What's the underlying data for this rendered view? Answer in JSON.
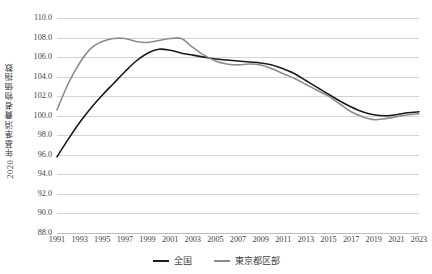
{
  "chart_data": {
    "type": "line",
    "title": "",
    "xlabel": "",
    "ylabel": "2020 年基準消費者物価指数",
    "ylim": [
      88.0,
      110.0
    ],
    "ytick_step": 2.0,
    "xlim": [
      1991,
      2023
    ],
    "xtick_step": 2,
    "grid": true,
    "legend_position": "bottom",
    "ytick_labels": [
      "110.0",
      "108.0",
      "106.0",
      "104.0",
      "102.0",
      "100.0",
      "98.0",
      "96.0",
      "94.0",
      "92.0",
      "90.0",
      "88.0"
    ],
    "ytick_values": [
      110.0,
      108.0,
      106.0,
      104.0,
      102.0,
      100.0,
      98.0,
      96.0,
      94.0,
      92.0,
      90.0,
      88.0
    ],
    "xtick_labels": [
      "1991",
      "1993",
      "1995",
      "1997",
      "1999",
      "2001",
      "2003",
      "2005",
      "2007",
      "2009",
      "2011",
      "2013",
      "2015",
      "2017",
      "2019",
      "2021",
      "2023"
    ],
    "x": [
      1991,
      1992,
      1993,
      1994,
      1995,
      1996,
      1997,
      1998,
      1999,
      2000,
      2001,
      2002,
      2003,
      2004,
      2005,
      2006,
      2007,
      2008,
      2009,
      2010,
      2011,
      2012,
      2013,
      2014,
      2015,
      2016,
      2017,
      2018,
      2019,
      2020,
      2021,
      2022,
      2023
    ],
    "series": [
      {
        "name": "全国",
        "color": "#1a1a1a",
        "values": [
          95.8,
          97.4,
          98.7,
          99.4,
          99.8,
          99.9,
          101.0,
          101.5,
          106.5,
          106.8,
          106.6,
          106.2,
          105.9,
          105.8,
          105.6,
          105.8,
          105.8,
          107.2,
          105.8,
          105.1,
          104.9,
          104.8,
          105.1,
          107.9,
          108.6,
          108.5,
          108.7,
          109.4,
          109.8,
          100.0,
          100.1,
          102.6,
          105.8
        ]
      },
      {
        "name": "東京都区部",
        "color": "#8c8c8c",
        "values": [
          100.6,
          103.3,
          105.4,
          106.9,
          107.9,
          107.9,
          107.8,
          107.5,
          107.5,
          107.6,
          107.9,
          107.9,
          106.9,
          105.6,
          105.0,
          104.9,
          104.9,
          105.6,
          104.8,
          103.8,
          103.1,
          102.6,
          102.4,
          102.1,
          101.3,
          100.4,
          99.8,
          99.7,
          100.0,
          100.0,
          100.0,
          100.1,
          100.3
        ]
      }
    ],
    "display_series": [
      {
        "name": "全国",
        "color": "#1a1a1a",
        "width": 1.6,
        "points": [
          [
            1991,
            95.8
          ],
          [
            1992,
            97.6
          ],
          [
            1993,
            99.3
          ],
          [
            1994,
            100.8
          ],
          [
            1995,
            102.1
          ],
          [
            1996,
            103.3
          ],
          [
            1997,
            104.5
          ],
          [
            1998,
            105.6
          ],
          [
            1999,
            106.4
          ],
          [
            2000,
            106.8
          ],
          [
            2001,
            106.7
          ],
          [
            2002,
            106.4
          ],
          [
            2003,
            106.2
          ],
          [
            2004,
            106.0
          ],
          [
            2005,
            105.8
          ],
          [
            2006,
            105.7
          ],
          [
            2007,
            105.6
          ],
          [
            2008,
            105.5
          ],
          [
            2009,
            105.4
          ],
          [
            2010,
            105.2
          ],
          [
            2011,
            104.8
          ],
          [
            2012,
            104.3
          ],
          [
            2013,
            103.6
          ],
          [
            2014,
            102.9
          ],
          [
            2015,
            102.2
          ],
          [
            2016,
            101.5
          ],
          [
            2017,
            100.9
          ],
          [
            2018,
            100.4
          ],
          [
            2019,
            100.1
          ],
          [
            2020,
            100.0
          ],
          [
            2021,
            100.1
          ],
          [
            2022,
            100.3
          ],
          [
            2023,
            100.4
          ]
        ]
      },
      {
        "name": "東京都区部",
        "color": "#8c8c8c",
        "width": 1.6,
        "points": [
          [
            1991,
            100.6
          ],
          [
            1992,
            103.3
          ],
          [
            1993,
            105.4
          ],
          [
            1994,
            106.9
          ],
          [
            1995,
            107.6
          ],
          [
            1996,
            107.9
          ],
          [
            1997,
            107.9
          ],
          [
            1998,
            107.6
          ],
          [
            1999,
            107.5
          ],
          [
            2000,
            107.7
          ],
          [
            2001,
            107.9
          ],
          [
            2002,
            107.9
          ],
          [
            2003,
            107.0
          ],
          [
            2004,
            106.2
          ],
          [
            2005,
            105.6
          ],
          [
            2006,
            105.3
          ],
          [
            2007,
            105.2
          ],
          [
            2008,
            105.3
          ],
          [
            2009,
            105.2
          ],
          [
            2010,
            104.8
          ],
          [
            2011,
            104.3
          ],
          [
            2012,
            103.8
          ],
          [
            2013,
            103.2
          ],
          [
            2014,
            102.6
          ],
          [
            2015,
            102.0
          ],
          [
            2016,
            101.2
          ],
          [
            2017,
            100.4
          ],
          [
            2018,
            99.9
          ],
          [
            2019,
            99.6
          ],
          [
            2020,
            99.7
          ],
          [
            2021,
            99.9
          ],
          [
            2022,
            100.1
          ],
          [
            2023,
            100.2
          ]
        ]
      }
    ],
    "legend": [
      {
        "label": "全国",
        "color": "#1a1a1a"
      },
      {
        "label": "東京都区部",
        "color": "#8c8c8c"
      }
    ]
  }
}
